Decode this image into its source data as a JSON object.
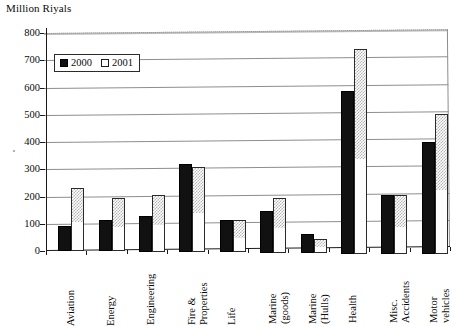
{
  "chart_data": {
    "type": "bar",
    "title": "Million Riyals",
    "xlabel": "",
    "ylabel": "Million Riyals",
    "ylim": [
      0,
      800
    ],
    "ytick_step": 100,
    "yticks": [
      "0",
      "100",
      "200",
      "300",
      "400",
      "500",
      "600",
      "700",
      "800"
    ],
    "grid": true,
    "legend_position": "top-left-inside",
    "categories": [
      "Aviation",
      "Energy",
      "Engineering",
      "Fire &\nProperties",
      "Life",
      "Marine\n(goods)",
      "Marine\n(Hulls)",
      "Health",
      "Misc.\nAccidents",
      "Motor\nvehicles"
    ],
    "series": [
      {
        "name": "2000",
        "color": "#111111",
        "values": [
          92,
          115,
          130,
          322,
          118,
          155,
          72,
          595,
          215,
          412
        ]
      },
      {
        "name": "2001",
        "color": "#ffffff",
        "values": [
          232,
          195,
          210,
          312,
          118,
          200,
          52,
          750,
          215,
          515
        ]
      }
    ]
  },
  "legend": {
    "items": [
      {
        "label": "2000",
        "style": "filled-black"
      },
      {
        "label": "2001",
        "style": "open-white"
      }
    ]
  },
  "axis": {
    "y_max_label": "800",
    "y_min_label": "0"
  }
}
